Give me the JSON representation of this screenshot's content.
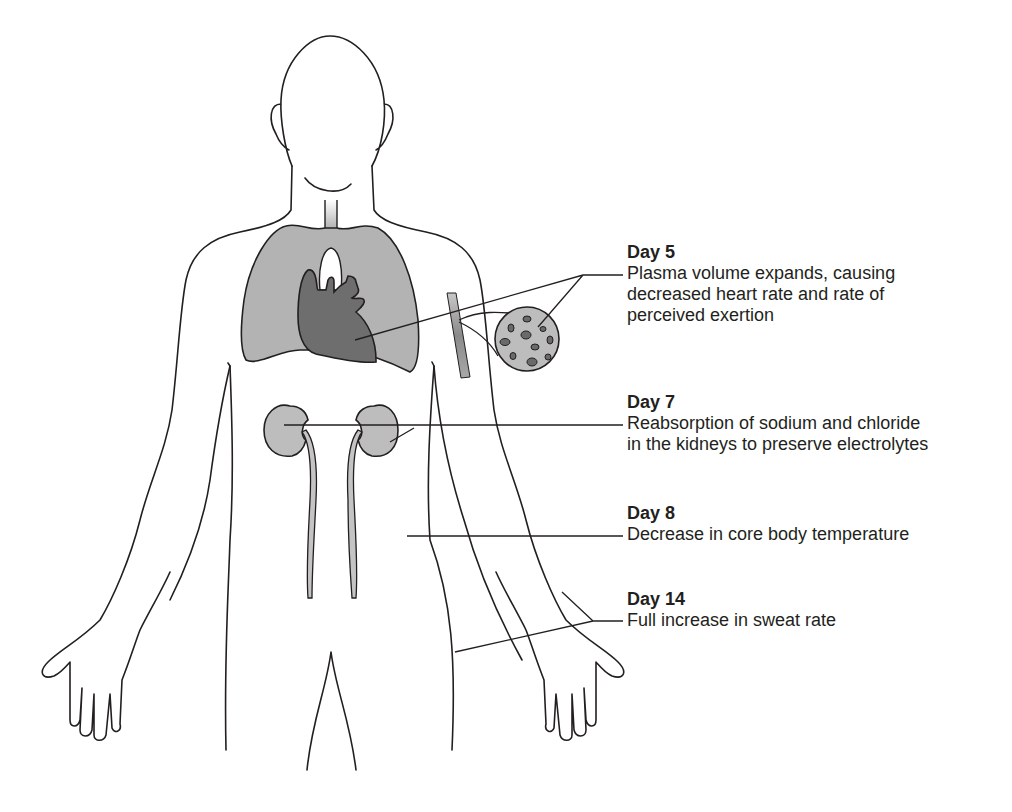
{
  "diagram": {
    "colors": {
      "outline": "#231f20",
      "lung_fill": "#b3b3b3",
      "heart_fill": "#6e6e6e",
      "kidney_fill": "#bdbdbd",
      "vessel_fill": "#9a9a9a",
      "cell_fill": "#6a6a6a",
      "background": "#ffffff"
    },
    "labels": [
      {
        "day": "Day 5",
        "description": "Plasma volume expands, causing\ndecreased heart rate and rate of\nperceived exertion",
        "points_to": [
          "heart",
          "blood vessel / plasma"
        ]
      },
      {
        "day": "Day 7",
        "description": "Reabsorption of sodium and chloride\nin the kidneys to preserve electrolytes",
        "points_to": [
          "kidneys"
        ]
      },
      {
        "day": "Day 8",
        "description": "Decrease in core body temperature",
        "points_to": [
          "torso"
        ]
      },
      {
        "day": "Day 14",
        "description": "Full increase in sweat rate",
        "points_to": [
          "skin of arm/torso"
        ]
      }
    ]
  }
}
